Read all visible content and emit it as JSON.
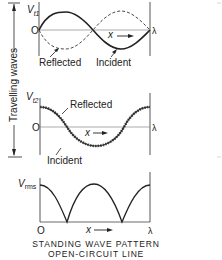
{
  "side_label": "Travelling waves",
  "graph1": {
    "y_label": "V",
    "y_sub": "t1",
    "origin_label": "O",
    "x_label": "x",
    "end_label": "λ",
    "reflected_label": "Reflected",
    "incident_label": "Incident"
  },
  "graph2": {
    "y_label": "V",
    "y_sub": "t2",
    "origin_label": "O",
    "x_label": "x",
    "end_label": "λ",
    "reflected_label": "Reflected",
    "incident_label": "Incident"
  },
  "graph3": {
    "y_label": "V",
    "y_sub": "rms",
    "origin_label": "O",
    "x_label": "x",
    "end_label": "λ"
  },
  "caption": {
    "line1": "STANDING WAVE PATTERN",
    "line2": "OPEN-CIRCUIT LINE"
  },
  "colors": {
    "ink": "#222222",
    "axis": "#888888"
  }
}
